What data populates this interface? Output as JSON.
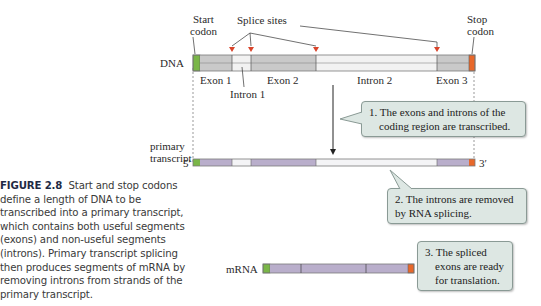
{
  "diagram": {
    "labels": {
      "start_codon_1": "Start",
      "start_codon_2": "codon",
      "splice_sites": "Splice sites",
      "stop_codon_1": "Stop",
      "stop_codon_2": "codon",
      "dna": "DNA",
      "exon1": "Exon 1",
      "intron1": "Intron 1",
      "exon2": "Exon 2",
      "intron2": "Intron 2",
      "exon3": "Exon 3",
      "primary_1": "primary",
      "primary_2": "transcript",
      "five_prime": "5′",
      "three_prime": "3′",
      "mrna": "mRNA"
    },
    "callouts": {
      "step1_line1": "1. The exons and introns of the",
      "step1_line2": "coding region are transcribed.",
      "step2_line1": "2. The introns are removed",
      "step2_line2": "by RNA splicing.",
      "step3_line1": "3. The spliced",
      "step3_line2": "exons are ready",
      "step3_line3": "for translation."
    },
    "colors": {
      "start_codon": "#7ab648",
      "stop_codon": "#e8682a",
      "dna_exon": "#c9c9c9",
      "dna_intron": "#f2f2f2",
      "rna_exon": "#b9aecb",
      "rna_intron": "#f4f4f6",
      "splice_arrow": "#d9442b",
      "callout_bg": "#dde7e3"
    }
  },
  "caption": {
    "figure_label": "FIGURE 2.8",
    "text": "Start and stop codons define a length of DNA to be transcribed into a primary transcript, which contains both useful segments (exons) and non-useful segments (introns). Primary transcript splicing then produces segments of mRNA by removing introns from strands of the primary transcript."
  }
}
